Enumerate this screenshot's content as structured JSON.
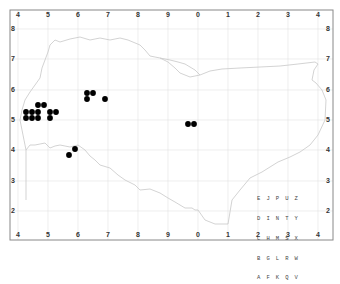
{
  "map": {
    "frame": {
      "left": 10,
      "top": 10,
      "right": 333,
      "bottom": 240
    },
    "grid_color": "#e3e3e3",
    "coast_color": "#c8c8c8",
    "dot_color": "#000000",
    "x_labels": [
      "4",
      "5",
      "6",
      "7",
      "8",
      "9",
      "0",
      "1",
      "2",
      "3",
      "4"
    ],
    "x_positions": [
      18,
      48,
      78,
      108,
      138,
      168,
      198,
      228,
      258,
      288,
      318
    ],
    "y_labels": [
      "8",
      "7",
      "6",
      "5",
      "4",
      "3",
      "2"
    ],
    "y_positions": [
      29,
      59,
      90,
      120,
      150,
      181,
      211
    ],
    "dots": [
      [
        38,
        105
      ],
      [
        44,
        105
      ],
      [
        26,
        112
      ],
      [
        32,
        112
      ],
      [
        38,
        112
      ],
      [
        50,
        112
      ],
      [
        56,
        112
      ],
      [
        26,
        118
      ],
      [
        32,
        118
      ],
      [
        38,
        118
      ],
      [
        50,
        118
      ],
      [
        87,
        93
      ],
      [
        93,
        93
      ],
      [
        87,
        99
      ],
      [
        105,
        99
      ],
      [
        188,
        124
      ],
      [
        194,
        124
      ],
      [
        69,
        155
      ],
      [
        75,
        149
      ]
    ],
    "tetrad_key": {
      "rows": [
        "E J P U Z",
        "D I N T Y",
        "C H M S X",
        "B G L R W",
        "A F K Q V"
      ]
    }
  }
}
